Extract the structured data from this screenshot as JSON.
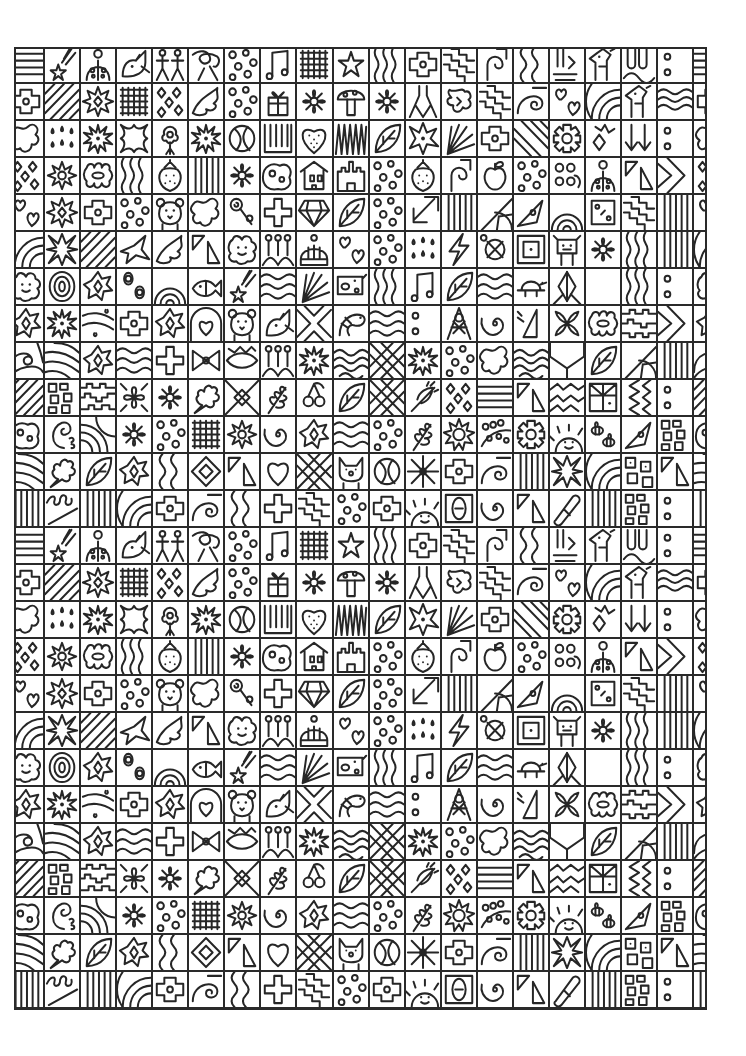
{
  "page": {
    "title": "",
    "kind": "doodle-grid coloring page"
  },
  "colors": {
    "background": "#ffffff",
    "line": "#262626"
  },
  "grid": {
    "columns": 19,
    "rows": 26,
    "cell_size": 37,
    "origin_x": 14,
    "origin_y": 47,
    "width": 693,
    "height": 963,
    "pattern_rows": [
      [
        "hlines",
        "star-trail",
        "ladybug",
        "bird",
        "figures",
        "leaf-loop",
        "circles",
        "music-notes",
        "grid",
        "star",
        "wavy-v",
        "puzzle",
        "zigzag",
        "spiral-hook",
        "waves-v",
        "tube",
        "giraffe",
        "u-shapes",
        "dots"
      ],
      [
        "puzzle",
        "diagonals",
        "sun-star",
        "grid",
        "diamonds",
        "wave-plume",
        "circles",
        "gift",
        "flower",
        "mushroom",
        "flower",
        "vee",
        "star-blob",
        "zigzag",
        "swirl",
        "hearts",
        "arcs",
        "giraffe",
        "waves"
      ],
      [
        "blob",
        "drops",
        "starburst",
        "cross-blob",
        "tree-flower",
        "starburst",
        "ball",
        "comb",
        "heart-dots",
        "zigzag-teeth",
        "leaf",
        "star-hole",
        "fan",
        "puzzle",
        "diagonals-r",
        "gear",
        "zigzag-arrow",
        "arrows-down",
        "dots"
      ],
      [
        "diamonds",
        "flower-star",
        "flower-oval",
        "wavy-v",
        "strawberry",
        "vlines",
        "flower",
        "blob-dots",
        "house",
        "castle",
        "circles",
        "strawberry",
        "spiral-hook",
        "apple",
        "circles",
        "flowers-stem",
        "ladybug",
        "triangles",
        "chevron"
      ],
      [
        "hearts",
        "sun-star",
        "puzzle",
        "circles",
        "bear",
        "blob",
        "lollipop",
        "cross",
        "gem",
        "leaf",
        "circles",
        "arrow-diag",
        "vlines",
        "sunburst",
        "rocket",
        "rainbow",
        "square-dots",
        "zigzag",
        "vlines"
      ],
      [
        "arcs",
        "star-x",
        "diagonals",
        "plane",
        "wave-plume",
        "triangles",
        "flower-face",
        "pins",
        "beanie",
        "hearts",
        "circles",
        "drops",
        "bolt",
        "circle-x",
        "square-in",
        "cow",
        "flower",
        "wavy-v",
        "vlines"
      ],
      [
        "flower-face",
        "target",
        "star-diamond",
        "flowers",
        "rainbow",
        "fish",
        "star-trail",
        "waves-h",
        "fan",
        "pig",
        "wavy-v",
        "music-notes",
        "leaf",
        "waves-h",
        "turtle",
        "diamond-leaf",
        "envelope",
        "wavy-v",
        "dots"
      ],
      [
        "star-diamond",
        "starburst",
        "fish-drops",
        "puzzle",
        "star-diamond",
        "heart-arch",
        "bear",
        "bird",
        "x-chevron",
        "shrimp",
        "waves-h",
        "dots",
        "tower",
        "spiral",
        "triangle-flag",
        "x-petals",
        "flower-oval",
        "puzzle-h",
        "chevron"
      ],
      [
        "wave",
        "swirl-lines",
        "star-diamond",
        "waves-h",
        "cross",
        "bow",
        "eye",
        "pins",
        "starburst",
        "scales",
        "lattice",
        "starburst",
        "circles",
        "blob",
        "scales",
        "chevron-v",
        "leaf",
        "sunburst",
        "vlines"
      ],
      [
        "diagonals",
        "blocks",
        "gear-h",
        "star-petals",
        "flower",
        "oak-leaf",
        "diamond-x",
        "branch",
        "cherries",
        "leaf",
        "lattice",
        "thorn",
        "diamonds",
        "hlines",
        "triangles",
        "wavy-h",
        "flag",
        "zigzag-v",
        "dots"
      ],
      [
        "blob-dots",
        "paisley",
        "arcs-corner",
        "flower",
        "circles",
        "grid",
        "flower-star",
        "spiral",
        "star-diamond",
        "waves-h",
        "circles",
        "branch",
        "sunflower",
        "dotted-loop",
        "gear",
        "sun-face",
        "bees",
        "rocket",
        "blocks"
      ],
      [
        "swirl-lines",
        "oak-leaf",
        "leaf",
        "star-diamond",
        "waves-v",
        "diamond-in",
        "triangles",
        "heart",
        "lattice",
        "cat",
        "ball",
        "snowflake",
        "puzzle",
        "swirl",
        "vlines",
        "star-x",
        "arcs",
        "blocks-dots",
        "triangles"
      ],
      [
        "vlines",
        "loops",
        "vlines",
        "arcs",
        "puzzle",
        "swirl",
        "waves-v",
        "cross",
        "zigzag",
        "circles",
        "puzzle",
        "sun-face",
        "zero",
        "spiral",
        "triangles",
        "pill",
        "vlines",
        "blocks",
        "dots"
      ]
    ]
  }
}
